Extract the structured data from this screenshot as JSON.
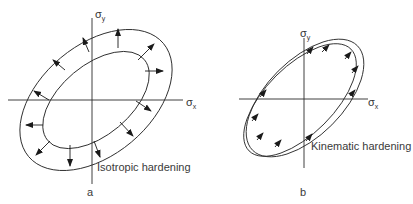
{
  "panels": [
    {
      "id": "a",
      "label": "a",
      "caption": "Isotropic hardening",
      "axis_x": "σ",
      "axis_x_sub": "x",
      "axis_y": "σ",
      "axis_y_sub": "y"
    },
    {
      "id": "b",
      "label": "b",
      "caption": "Kinematic hardening",
      "axis_x": "σ",
      "axis_x_sub": "x",
      "axis_y": "σ",
      "axis_y_sub": "y"
    }
  ],
  "colors": {
    "line": "#2a2a2a",
    "text": "#3a3a3a"
  }
}
